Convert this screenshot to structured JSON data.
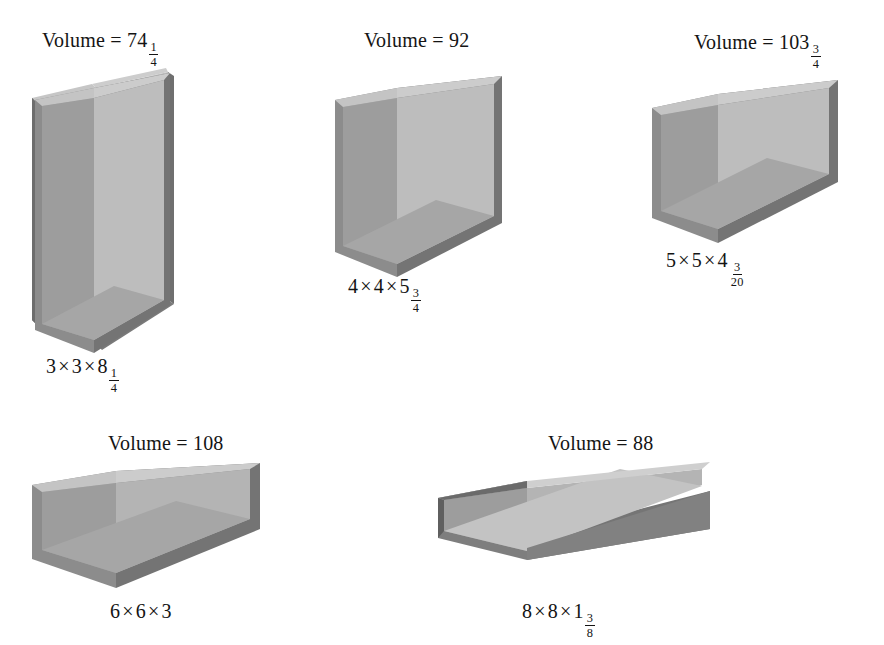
{
  "page": {
    "background": "#ffffff",
    "title_prefix": "Volume",
    "equals": "=",
    "times_symbol": "×"
  },
  "palette": {
    "interior_floor": "#9a9a9a",
    "interior_back_wall": "#b9b9b9",
    "interior_left_wall": "#8d8d8d",
    "rim_top_left": "#c2c2c2",
    "outer_left_wall": "#5f5f5f",
    "outer_front_wall": "#7c7c7c",
    "rim_front": "#6e6e6e",
    "text": "#141414"
  },
  "figures": [
    {
      "id": "figure-1",
      "volume_label": "Volume = 74",
      "volume_whole": "74",
      "volume_fraction": {
        "numerator": "1",
        "denominator": "4"
      },
      "volume_value": 74.25,
      "dimensions_label": "3 × 3 × 8",
      "dim_a": "3",
      "dim_b": "3",
      "dim_c_whole": "8",
      "dim_c_fraction": {
        "numerator": "1",
        "denominator": "4"
      },
      "dims": [
        3,
        3,
        8.25
      ]
    },
    {
      "id": "figure-2",
      "volume_label": "Volume = 92",
      "volume_whole": "92",
      "volume_fraction": null,
      "volume_value": 92,
      "dimensions_label": "4 × 4 × 5",
      "dim_a": "4",
      "dim_b": "4",
      "dim_c_whole": "5",
      "dim_c_fraction": {
        "numerator": "3",
        "denominator": "4"
      },
      "dims": [
        4,
        4,
        5.75
      ]
    },
    {
      "id": "figure-3",
      "volume_label": "Volume = 103",
      "volume_whole": "103",
      "volume_fraction": {
        "numerator": "3",
        "denominator": "4"
      },
      "volume_value": 103.75,
      "dimensions_label": "5 × 5 × 4",
      "dim_a": "5",
      "dim_b": "5",
      "dim_c_whole": "4",
      "dim_c_fraction": {
        "numerator": "3",
        "denominator": "20"
      },
      "dims": [
        5,
        5,
        4.15
      ]
    },
    {
      "id": "figure-4",
      "volume_label": "Volume = 108",
      "volume_whole": "108",
      "volume_fraction": null,
      "volume_value": 108,
      "dimensions_label": "6 × 6 × 3",
      "dim_a": "6",
      "dim_b": "6",
      "dim_c_whole": "3",
      "dim_c_fraction": null,
      "dims": [
        6,
        6,
        3
      ]
    },
    {
      "id": "figure-5",
      "volume_label": "Volume = 88",
      "volume_whole": "88",
      "volume_fraction": null,
      "volume_value": 88,
      "dimensions_label": "8 × 8 × 1",
      "dim_a": "8",
      "dim_b": "8",
      "dim_c_whole": "1",
      "dim_c_fraction": {
        "numerator": "3",
        "denominator": "8"
      },
      "dims": [
        8,
        8,
        1.375
      ]
    }
  ]
}
